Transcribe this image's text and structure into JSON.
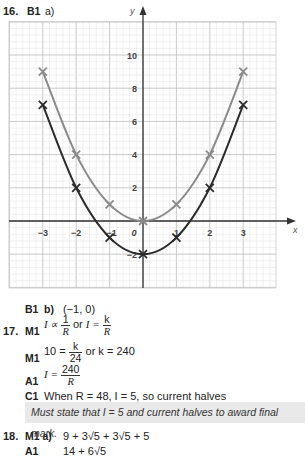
{
  "q16": {
    "number": "16.",
    "mark_a": "B1",
    "part_a": "a)",
    "mark_b": "B1",
    "part_b": "b)",
    "answer_b": "(−1, 0)"
  },
  "chart_data": {
    "type": "line",
    "title": "",
    "xlabel": "x",
    "ylabel": "y",
    "xlim": [
      -4,
      4
    ],
    "ylim": [
      -3.5,
      12
    ],
    "grid": true,
    "x_ticks": [
      -3,
      -2,
      -1,
      0,
      1,
      2,
      3
    ],
    "x_tick_labels": [
      "−3",
      "−2",
      "−1",
      "0",
      "1",
      "2",
      "3"
    ],
    "y_ticks": [
      -2,
      2,
      4,
      6,
      8,
      10
    ],
    "y_tick_labels": [
      "−2",
      "2",
      "4",
      "6",
      "8",
      "10"
    ],
    "series": [
      {
        "name": "y = x²",
        "color": "#8a8a8a",
        "x": [
          -3,
          -2,
          -1,
          0,
          1,
          2,
          3
        ],
        "y": [
          9,
          4,
          1,
          0,
          1,
          4,
          9
        ]
      },
      {
        "name": "y = x² − 2",
        "color": "#2b2b2b",
        "x": [
          -3,
          -2,
          -1,
          0,
          1,
          2,
          3
        ],
        "y": [
          7,
          2,
          -1,
          -2,
          -1,
          2,
          7
        ]
      }
    ]
  },
  "q17": {
    "number": "17.",
    "line1": {
      "mark": "M1",
      "prefix": "I ∝",
      "f1_num": "1",
      "f1_den": "R",
      "or": "or",
      "prefix2": "I =",
      "f2_num": "k",
      "f2_den": "R"
    },
    "line2": {
      "mark": "M1",
      "prefix": "10 =",
      "f_num": "k",
      "f_den": "24",
      "suffix": "or k = 240"
    },
    "line3": {
      "mark": "A1",
      "prefix": "I =",
      "f_num": "240",
      "f_den": "R"
    },
    "line4": {
      "mark": "C1",
      "text": "When R = 48, I = 5, so current halves"
    },
    "note": "Must state that I = 5 and current halves to award final mark."
  },
  "q18": {
    "number": "18.",
    "line1": {
      "mark": "M1 a)",
      "text": "9 + 3√5  + 3√5  + 5"
    },
    "line2": {
      "mark": "A1",
      "text": "14 + 6√5"
    }
  }
}
